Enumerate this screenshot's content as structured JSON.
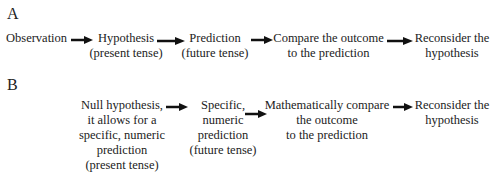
{
  "panel_a": {
    "label": "A",
    "nodes": [
      {
        "line1": "Observation",
        "line2": ""
      },
      {
        "line1": "Hypothesis",
        "line2": "(present tense)"
      },
      {
        "line1": "Prediction",
        "line2": "(future tense)"
      },
      {
        "line1": "Compare the outcome",
        "line2": "to the prediction"
      },
      {
        "line1": "Reconsider the",
        "line2": "hypothesis"
      }
    ]
  },
  "panel_b": {
    "label": "B",
    "nodes": [
      {
        "lines": [
          "Null hypothesis,",
          "it allows for a",
          "specific, numeric",
          "prediction",
          "(present tense)"
        ]
      },
      {
        "lines": [
          "Specific,",
          "numeric",
          "prediction",
          "(future tense)"
        ]
      },
      {
        "lines": [
          "Mathematically compare",
          "the outcome",
          "to the prediction"
        ]
      },
      {
        "lines": [
          "Reconsider the",
          "hypothesis"
        ]
      }
    ]
  },
  "colors": {
    "text": "#222222",
    "arrow": "#111111",
    "background": "#ffffff"
  }
}
